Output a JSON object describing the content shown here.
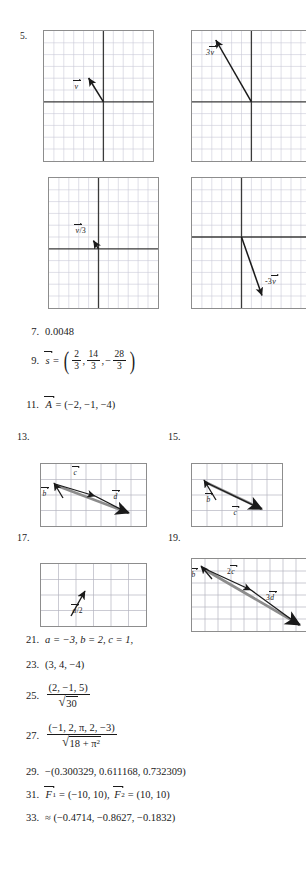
{
  "document": {
    "kind": "textbook-answer-key-page",
    "background_color": "#ffffff",
    "ink_color": "#1a1a1a"
  },
  "problem_5": {
    "number": "5.",
    "plots": [
      {
        "id": "plot-v",
        "label": "v",
        "label_text": "v⃗",
        "cols": 11,
        "rows": 11,
        "origin_col": 6,
        "origin_row": 5,
        "vector_dx": -1.3,
        "vector_dy": 2.1,
        "grid_color": "#c9c9d6",
        "axis_color": "#3a3a3a",
        "vector_color": "#1a1a1a"
      },
      {
        "id": "plot-3v",
        "label": "3v",
        "label_text": "3v⃗",
        "cols": 11,
        "rows": 11,
        "origin_col": 6,
        "origin_row": 6,
        "vector_dx": -3.9,
        "vector_dy": 6.3,
        "grid_color": "#c9c9d6",
        "axis_color": "#3a3a3a",
        "vector_color": "#1a1a1a"
      },
      {
        "id": "plot-v-over-3",
        "label": "v/3",
        "label_text": "v⃗/3",
        "cols": 11,
        "rows": 11,
        "origin_col": 5,
        "origin_row": 5,
        "vector_dx": -0.45,
        "vector_dy": 0.7,
        "grid_color": "#c9c9d6",
        "axis_color": "#3a3a3a",
        "vector_color": "#1a1a1a"
      },
      {
        "id": "plot-neg-3v",
        "label": "-3v",
        "label_text": "-3v⃗",
        "cols": 11,
        "rows": 11,
        "origin_col": 5,
        "origin_row": 4,
        "vector_dx": 2.1,
        "vector_dy": -5.0,
        "grid_color": "#c9c9d6",
        "axis_color": "#3a3a3a",
        "vector_color": "#1a1a1a"
      }
    ]
  },
  "answers": {
    "a7": {
      "number": "7.",
      "value": "0.0048"
    },
    "a9": {
      "number": "9.",
      "lhs_symbol": "s",
      "equals": "=",
      "components": [
        {
          "num": "2",
          "den": "3",
          "sign": ""
        },
        {
          "num": "14",
          "den": "3",
          "sign": ""
        },
        {
          "num": "28",
          "den": "3",
          "sign": "−"
        }
      ],
      "separator": ","
    },
    "a11": {
      "number": "11.",
      "lhs_symbol": "A",
      "equals": "=",
      "value": "(−2, −1, −4)"
    },
    "a21": {
      "number": "21.",
      "value": "a = −3, b = 2, c = 1,"
    },
    "a23": {
      "number": "23.",
      "value": "(3, 4, −4)"
    },
    "a25": {
      "number": "25.",
      "numerator": "(2, −1, 5)",
      "radicand": "30"
    },
    "a27": {
      "number": "27.",
      "numerator": "(−1, 2, π, 2, −3)",
      "radicand_base": "18 + π",
      "radicand_exp": "2"
    },
    "a29": {
      "number": "29.",
      "value": "−(0.300329, 0.611168, 0.732309)"
    },
    "a31": {
      "number": "31.",
      "f1_symbol": "F",
      "f1_sub": "1",
      "f1_value": "(−10, 10)",
      "f2_symbol": "F",
      "f2_sub": "2",
      "f2_value": "(10, 10)",
      "equals": "=",
      "separator": ","
    },
    "a33": {
      "number": "33.",
      "value": "≈ (−0.4714, −0.8627, −0.1832)"
    }
  },
  "problem_13": {
    "number": "13.",
    "cols": 7,
    "rows": 4,
    "grid_color": "#b4b4c0",
    "resultant_color": "#8c8c8c",
    "vector_color": "#1a1a1a",
    "labels": [
      {
        "text": "b",
        "vector": true
      },
      {
        "text": "c",
        "vector": true
      },
      {
        "text": "d",
        "vector": true
      }
    ]
  },
  "problem_15": {
    "number": "15.",
    "cols": 5,
    "rows": 4,
    "grid_color": "#b4b4c0",
    "resultant_color": "#8c8c8c",
    "vector_color": "#1a1a1a",
    "labels": [
      {
        "text": "b",
        "vector": true
      },
      {
        "text": "c",
        "vector": true
      }
    ]
  },
  "problem_17": {
    "number": "17.",
    "cols": 6,
    "rows": 4,
    "grid_color": "#b4b4c0",
    "vector_color": "#1a1a1a",
    "labels": [
      {
        "text": "a/2",
        "vector": true
      }
    ]
  },
  "problem_19": {
    "number": "19.",
    "cols": 8,
    "rows": 6,
    "grid_color": "#b4b4c0",
    "resultant_color": "#8c8c8c",
    "vector_color": "#1a1a1a",
    "labels": [
      {
        "text": "b",
        "vector": true
      },
      {
        "text": "2c",
        "vector": true
      },
      {
        "text": "3d",
        "vector": true
      }
    ]
  }
}
